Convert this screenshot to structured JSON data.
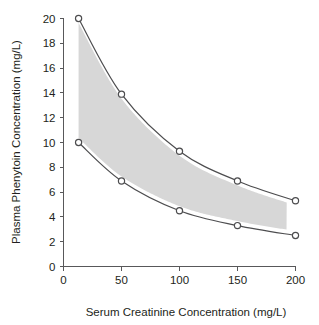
{
  "chart_data": {
    "type": "line",
    "title": "",
    "subtitle": "",
    "xlabel": "Serum Creatinine Concentration (mg/L)",
    "ylabel": "Plasma Phenytoin Concentration (mg/L)",
    "xlim": [
      0,
      200
    ],
    "ylim": [
      0,
      20
    ],
    "xticks": [
      0,
      50,
      100,
      150,
      200
    ],
    "yticks": [
      0,
      2,
      4,
      6,
      8,
      10,
      12,
      14,
      16,
      18,
      20
    ],
    "xtick_labels": [
      "0",
      "50",
      "100",
      "150",
      "200"
    ],
    "ytick_labels": [
      "0",
      "2",
      "4",
      "6",
      "8",
      "10",
      "12",
      "14",
      "16",
      "18",
      "20"
    ],
    "grid": false,
    "legend": null,
    "legend_position": "none",
    "x": [
      13,
      50,
      100,
      150,
      200
    ],
    "series": [
      {
        "name": "Upper limit",
        "values": [
          20.0,
          13.9,
          9.3,
          6.9,
          5.3
        ],
        "marker": "open-circle",
        "color": "#4d4d4f"
      },
      {
        "name": "Lower limit",
        "values": [
          10.0,
          6.9,
          4.5,
          3.3,
          2.5
        ],
        "marker": "open-circle",
        "color": "#4d4d4f"
      }
    ],
    "shaded_band": {
      "name": "Therapeutic range band",
      "between": [
        "Upper limit",
        "Lower limit"
      ],
      "color": "#d7d7d7"
    },
    "colors": {
      "curve": "#4d4d4f",
      "band": "#d7d7d7",
      "axis": "#58585a",
      "text": "#231f20",
      "background": "#ffffff"
    }
  }
}
